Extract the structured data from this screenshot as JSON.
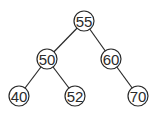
{
  "diagram": {
    "type": "binary-search-tree",
    "nodes": [
      {
        "id": "n55",
        "label": "55",
        "x": 84,
        "y": 21
      },
      {
        "id": "n50",
        "label": "50",
        "x": 47,
        "y": 59
      },
      {
        "id": "n60",
        "label": "60",
        "x": 111,
        "y": 59
      },
      {
        "id": "n40",
        "label": "40",
        "x": 19,
        "y": 96
      },
      {
        "id": "n52",
        "label": "52",
        "x": 75,
        "y": 96
      },
      {
        "id": "n70",
        "label": "70",
        "x": 138,
        "y": 96
      }
    ],
    "edges": [
      {
        "from": "n55",
        "to": "n50"
      },
      {
        "from": "n55",
        "to": "n60"
      },
      {
        "from": "n50",
        "to": "n40"
      },
      {
        "from": "n50",
        "to": "n52"
      },
      {
        "from": "n60",
        "to": "n70"
      }
    ],
    "node_radius": 10,
    "colors": {
      "stroke": "#2a2a2a",
      "fill": "#ffffff",
      "text": "#2a2a2a"
    }
  }
}
